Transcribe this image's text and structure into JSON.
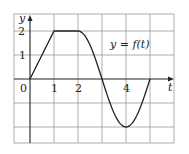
{
  "chart_data": {
    "type": "line",
    "title": "",
    "annotation": "y = f(t)",
    "xlabel": "t",
    "ylabel": "y",
    "x_tick_labels": [
      "0",
      "1",
      "2",
      "4"
    ],
    "y_tick_labels": [
      "1",
      "2"
    ],
    "xlim": [
      -0.67,
      6.0
    ],
    "ylim": [
      -2.67,
      2.67
    ],
    "grid": true,
    "legend": "none",
    "series": [
      {
        "name": "f(t)",
        "x": [
          0,
          1,
          2,
          2.25,
          2.5,
          2.75,
          3,
          3.25,
          3.5,
          3.75,
          4,
          4.25,
          4.5,
          4.75,
          5
        ],
        "values": [
          0,
          2,
          2,
          1.85,
          1.41,
          0.77,
          0,
          -0.77,
          -1.41,
          -1.85,
          -2,
          -1.85,
          -1.41,
          -0.77,
          0
        ]
      }
    ]
  }
}
